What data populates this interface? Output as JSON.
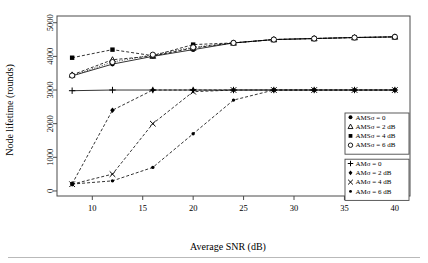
{
  "chart_data": {
    "type": "line",
    "title": "",
    "xlabel": "Average SNR (dB)",
    "ylabel": "Node lifetime (rounds)",
    "xlim": [
      6.5,
      41.5
    ],
    "ylim": [
      -150,
      5200
    ],
    "xticks": [
      10,
      15,
      20,
      25,
      30,
      35,
      40
    ],
    "yticks": [
      0,
      1000,
      2000,
      3000,
      4000,
      5000
    ],
    "grid": false,
    "legend_position": "right-middle",
    "x": [
      8,
      12,
      16,
      20,
      24,
      28,
      32,
      36,
      40
    ],
    "series": [
      {
        "name": "AMSσ = 0",
        "marker": "filled-circle",
        "linestyle": "solid",
        "values": [
          3420,
          3770,
          4000,
          4200,
          4400,
          4500,
          4530,
          4560,
          4580
        ]
      },
      {
        "name": "AMSσ = 2 dB",
        "marker": "triangle",
        "linestyle": "dashed",
        "values": [
          3450,
          3900,
          4010,
          4250,
          4400,
          4500,
          4530,
          4560,
          4580
        ]
      },
      {
        "name": "AMSσ = 4 dB",
        "marker": "filled-square",
        "linestyle": "dashed",
        "values": [
          3960,
          4200,
          4020,
          4350,
          4400,
          4500,
          4530,
          4560,
          4580
        ]
      },
      {
        "name": "AMSσ = 6 dB",
        "marker": "open-circle",
        "linestyle": "dotted",
        "values": [
          3430,
          3830,
          4050,
          4270,
          4400,
          4500,
          4530,
          4560,
          4580
        ]
      },
      {
        "name": "AMσ = 0",
        "marker": "plus",
        "linestyle": "solid",
        "values": [
          2980,
          3000,
          3000,
          3000,
          3000,
          3000,
          3000,
          3000,
          3000
        ]
      },
      {
        "name": "AMσ = 2 dB",
        "marker": "filled-diamond",
        "linestyle": "dashed",
        "values": [
          210,
          2400,
          3000,
          3000,
          3000,
          3000,
          3000,
          3000,
          3000
        ]
      },
      {
        "name": "AMσ = 4 dB",
        "marker": "cross",
        "linestyle": "dashed",
        "values": [
          200,
          500,
          2000,
          2950,
          3000,
          3000,
          3000,
          3000,
          3000
        ]
      },
      {
        "name": "AMσ = 6 dB",
        "marker": "small-filled-circle",
        "linestyle": "dashed",
        "values": [
          205,
          300,
          700,
          1700,
          2700,
          3000,
          3000,
          3000,
          3000
        ]
      }
    ],
    "legend_groups": [
      {
        "id": "ams-group",
        "entries": [
          {
            "marker": "filled-circle",
            "label": "AMSσ = 0"
          },
          {
            "marker": "triangle",
            "label": "AMSσ = 2 dB"
          },
          {
            "marker": "filled-square",
            "label": "AMSσ = 4 dB"
          },
          {
            "marker": "open-circle",
            "label": "AMSσ = 6 dB"
          }
        ]
      },
      {
        "id": "am-group",
        "entries": [
          {
            "marker": "plus",
            "label": "AMσ = 0"
          },
          {
            "marker": "filled-diamond",
            "label": "AMσ = 2 dB"
          },
          {
            "marker": "cross",
            "label": "AMσ = 4 dB"
          },
          {
            "marker": "small-filled-circle",
            "label": "AMσ = 6 dB"
          }
        ]
      }
    ]
  },
  "colors": {
    "ink": "#000000",
    "frame": "#4a4a4a",
    "footer_rule": "#b9b9b9",
    "background": "#ffffff"
  }
}
